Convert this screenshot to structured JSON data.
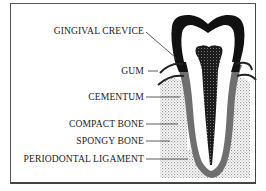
{
  "diagram": {
    "labels": [
      {
        "id": "gingival-crevice",
        "text": "GINGIVAL CREVICE",
        "y": 31
      },
      {
        "id": "gum",
        "text": "GUM",
        "y": 68
      },
      {
        "id": "cementum",
        "text": "CEMENTUM",
        "y": 94
      },
      {
        "id": "compact-bone",
        "text": "COMPACT BONE",
        "y": 121
      },
      {
        "id": "spongy-bone",
        "text": "SPONGY BONE",
        "y": 138
      },
      {
        "id": "periodontal-ligament",
        "text": "PERIODONTAL LIGAMENT",
        "y": 156
      }
    ],
    "colors": {
      "enamel": "#111111",
      "dentin": "#ffffff",
      "pulp": "#2a2a2a",
      "cementum": "#6f6f6f",
      "bone_stipple": "#bdbdbd",
      "line": "#333333"
    }
  }
}
